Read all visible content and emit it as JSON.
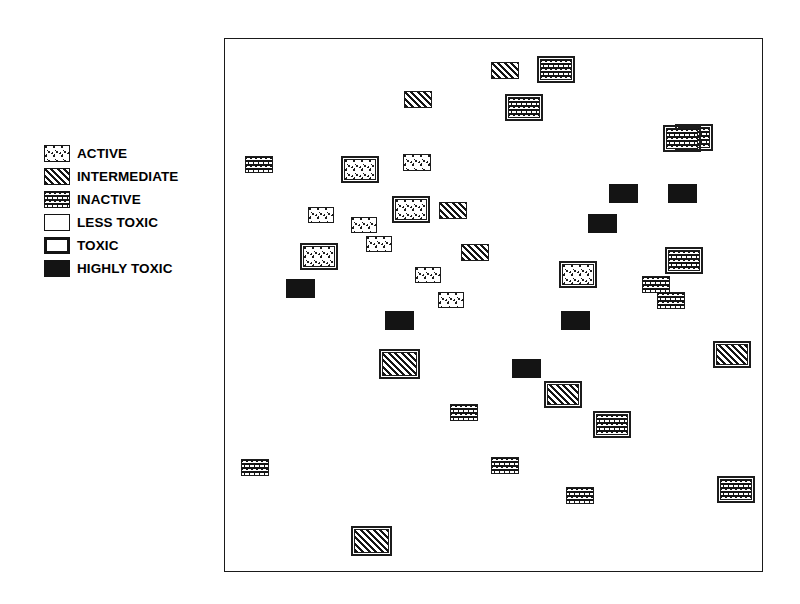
{
  "figure": {
    "type": "categorical-scatter",
    "background_color": "#ffffff",
    "frame_color": "#1a1a1a"
  },
  "legend": {
    "name": "legend",
    "items": [
      {
        "label": "ACTIVE",
        "pattern": "stipple-dots",
        "border": "thin",
        "swatch_class": "fill-active tox-less"
      },
      {
        "label": "INTERMEDIATE",
        "pattern": "diagonal-hatch",
        "border": "thin",
        "swatch_class": "fill-intermediate tox-less"
      },
      {
        "label": "INACTIVE",
        "pattern": "checkerboard",
        "border": "thin",
        "swatch_class": "fill-inactive tox-less"
      },
      {
        "label": "LESS TOXIC",
        "pattern": "none",
        "border": "thin",
        "swatch_class": "fill-none tox-less"
      },
      {
        "label": "TOXIC",
        "pattern": "none",
        "border": "thick",
        "swatch_class": "fill-none legend-thick"
      },
      {
        "label": "HIGHLY TOXIC",
        "pattern": "solid-black",
        "border": "none",
        "swatch_class": "tox-highly"
      }
    ]
  },
  "chart_data": {
    "type": "scatter",
    "title": "",
    "xlabel": "",
    "ylabel": "",
    "grid": false,
    "legend_position": "left-outside",
    "encoding": {
      "fill_pattern": "activity",
      "border_weight": "toxicity"
    },
    "activity_levels": [
      "ACTIVE",
      "INTERMEDIATE",
      "INACTIVE"
    ],
    "toxicity_levels": [
      "LESS TOXIC",
      "TOXIC",
      "HIGHLY TOXIC"
    ],
    "plot_frame_px": {
      "x": 224,
      "y": 38,
      "width": 539,
      "height": 534
    },
    "points": [
      {
        "x": 266,
        "y": 23,
        "w": 28,
        "h": 17,
        "activity": "INTERMEDIATE",
        "toxicity": "LESS TOXIC"
      },
      {
        "x": 315,
        "y": 20,
        "w": 32,
        "h": 21,
        "activity": "INACTIVE",
        "toxicity": "TOXIC"
      },
      {
        "x": 179,
        "y": 52,
        "w": 28,
        "h": 17,
        "activity": "INTERMEDIATE",
        "toxicity": "LESS TOXIC"
      },
      {
        "x": 283,
        "y": 58,
        "w": 32,
        "h": 21,
        "activity": "INACTIVE",
        "toxicity": "TOXIC"
      },
      {
        "x": 453,
        "y": 88,
        "w": 32,
        "h": 21,
        "activity": "INACTIVE",
        "toxicity": "TOXIC"
      },
      {
        "x": 20,
        "y": 117,
        "w": 28,
        "h": 17,
        "activity": "INACTIVE",
        "toxicity": "LESS TOXIC"
      },
      {
        "x": 119,
        "y": 120,
        "w": 32,
        "h": 21,
        "activity": "ACTIVE",
        "toxicity": "TOXIC"
      },
      {
        "x": 178,
        "y": 115,
        "w": 28,
        "h": 17,
        "activity": "ACTIVE",
        "toxicity": "LESS TOXIC"
      },
      {
        "x": 83,
        "y": 168,
        "w": 26,
        "h": 16,
        "activity": "ACTIVE",
        "toxicity": "LESS TOXIC"
      },
      {
        "x": 126,
        "y": 178,
        "w": 26,
        "h": 16,
        "activity": "ACTIVE",
        "toxicity": "LESS TOXIC"
      },
      {
        "x": 170,
        "y": 160,
        "w": 32,
        "h": 21,
        "activity": "ACTIVE",
        "toxicity": "TOXIC"
      },
      {
        "x": 214,
        "y": 163,
        "w": 28,
        "h": 17,
        "activity": "INTERMEDIATE",
        "toxicity": "LESS TOXIC"
      },
      {
        "x": 141,
        "y": 197,
        "w": 26,
        "h": 16,
        "activity": "ACTIVE",
        "toxicity": "LESS TOXIC"
      },
      {
        "x": 78,
        "y": 207,
        "w": 32,
        "h": 21,
        "activity": "ACTIVE",
        "toxicity": "TOXIC"
      },
      {
        "x": 236,
        "y": 205,
        "w": 28,
        "h": 17,
        "activity": "INTERMEDIATE",
        "toxicity": "LESS TOXIC"
      },
      {
        "x": 61,
        "y": 240,
        "w": 29,
        "h": 19,
        "activity": "ACTIVE",
        "toxicity": "HIGHLY TOXIC"
      },
      {
        "x": 190,
        "y": 228,
        "w": 26,
        "h": 16,
        "activity": "ACTIVE",
        "toxicity": "LESS TOXIC"
      },
      {
        "x": 213,
        "y": 253,
        "w": 26,
        "h": 16,
        "activity": "ACTIVE",
        "toxicity": "LESS TOXIC"
      },
      {
        "x": 337,
        "y": 225,
        "w": 32,
        "h": 21,
        "activity": "ACTIVE",
        "toxicity": "TOXIC"
      },
      {
        "x": 384,
        "y": 145,
        "w": 29,
        "h": 19,
        "activity": "ACTIVE",
        "toxicity": "HIGHLY TOXIC"
      },
      {
        "x": 443,
        "y": 145,
        "w": 29,
        "h": 19,
        "activity": "ACTIVE",
        "toxicity": "HIGHLY TOXIC"
      },
      {
        "x": 363,
        "y": 175,
        "w": 29,
        "h": 19,
        "activity": "ACTIVE",
        "toxicity": "HIGHLY TOXIC"
      },
      {
        "x": 441,
        "y": 89,
        "w": 32,
        "h": 21,
        "activity": "INACTIVE",
        "toxicity": "TOXIC"
      },
      {
        "x": 443,
        "y": 211,
        "w": 32,
        "h": 21,
        "activity": "INACTIVE",
        "toxicity": "TOXIC"
      },
      {
        "x": 417,
        "y": 237,
        "w": 28,
        "h": 17,
        "activity": "INACTIVE",
        "toxicity": "LESS TOXIC"
      },
      {
        "x": 432,
        "y": 253,
        "w": 28,
        "h": 17,
        "activity": "INACTIVE",
        "toxicity": "LESS TOXIC"
      },
      {
        "x": 160,
        "y": 272,
        "w": 29,
        "h": 19,
        "activity": "ACTIVE",
        "toxicity": "HIGHLY TOXIC"
      },
      {
        "x": 336,
        "y": 272,
        "w": 29,
        "h": 19,
        "activity": "ACTIVE",
        "toxicity": "HIGHLY TOXIC"
      },
      {
        "x": 287,
        "y": 320,
        "w": 29,
        "h": 19,
        "activity": "ACTIVE",
        "toxicity": "HIGHLY TOXIC"
      },
      {
        "x": 157,
        "y": 313,
        "w": 35,
        "h": 24,
        "activity": "INTERMEDIATE",
        "toxicity": "TOXIC"
      },
      {
        "x": 491,
        "y": 305,
        "w": 32,
        "h": 21,
        "activity": "INTERMEDIATE",
        "toxicity": "TOXIC"
      },
      {
        "x": 322,
        "y": 345,
        "w": 32,
        "h": 21,
        "activity": "INTERMEDIATE",
        "toxicity": "TOXIC"
      },
      {
        "x": 225,
        "y": 365,
        "w": 28,
        "h": 17,
        "activity": "INACTIVE",
        "toxicity": "LESS TOXIC"
      },
      {
        "x": 371,
        "y": 375,
        "w": 32,
        "h": 21,
        "activity": "INACTIVE",
        "toxicity": "TOXIC"
      },
      {
        "x": 16,
        "y": 420,
        "w": 28,
        "h": 17,
        "activity": "INACTIVE",
        "toxicity": "LESS TOXIC"
      },
      {
        "x": 266,
        "y": 418,
        "w": 28,
        "h": 17,
        "activity": "INACTIVE",
        "toxicity": "LESS TOXIC"
      },
      {
        "x": 341,
        "y": 448,
        "w": 28,
        "h": 17,
        "activity": "INACTIVE",
        "toxicity": "LESS TOXIC"
      },
      {
        "x": 495,
        "y": 440,
        "w": 32,
        "h": 21,
        "activity": "INACTIVE",
        "toxicity": "TOXIC"
      },
      {
        "x": 129,
        "y": 490,
        "w": 35,
        "h": 24,
        "activity": "INTERMEDIATE",
        "toxicity": "TOXIC"
      }
    ]
  }
}
